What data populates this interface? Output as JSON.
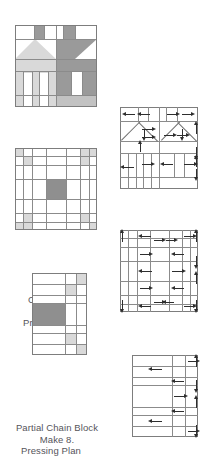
{
  "sheet": {
    "title_visible": false
  },
  "rows": [
    {
      "id": "house",
      "block": {
        "name": "House Block",
        "caption_line1": "House Block",
        "caption_line2": "Make 5.",
        "description": "Two-house pieced block: light-gray house on left, dark-gray house on right, each with chimney, roof triangles, wall band, and door/window strips.",
        "grid": "paired house units",
        "colors": {
          "background": "#ffffff",
          "light": "#d9d9d9",
          "medium": "#c2c2c2",
          "dark": "#9a9a9a",
          "line": "#8b8b8b"
        }
      },
      "plan": {
        "name": "Pressing Plan",
        "caption_line1": "Pressing Plan",
        "caption_line2": "",
        "arrow_count": 14,
        "arrow_directions": [
          "left",
          "left",
          "right",
          "right",
          "right",
          "right",
          "right",
          "right",
          "up",
          "left",
          "left",
          "left",
          "right",
          "right"
        ],
        "edge_arrows": [
          "up",
          "down",
          "up",
          "down",
          "up"
        ]
      }
    },
    {
      "id": "chain",
      "block": {
        "name": "Chain Block",
        "caption_line1": "Chain Block",
        "caption_line2": "Make 4.",
        "description": "Five-patch chain block with light-gray four-patch units in each corner and a dark-gray center square.",
        "grid": "5 x 5",
        "colors": {
          "background": "#ffffff",
          "light": "#d9d9d9",
          "dark": "#9a9a9a",
          "line": "#8b8b8b"
        }
      },
      "plan": {
        "name": "Pressing Plan",
        "caption_line1": "Pressing Plan",
        "caption_line2": "",
        "arrow_count": 14,
        "arrow_directions": [
          "left",
          "right",
          "right",
          "left",
          "left",
          "right",
          "left",
          "right",
          "left",
          "right",
          "left",
          "right",
          "left",
          "right"
        ],
        "edge_arrows": [
          "up",
          "up",
          "down",
          "up",
          "down",
          "down"
        ]
      }
    },
    {
      "id": "partial",
      "block": {
        "name": "Partial Chain Block",
        "caption_line1": "Partial Chain Block",
        "caption_line2": "Make 8.",
        "description": "Three-column partial chain block with light-gray four-patch units on the right edge and a dark-gray square at the left middle.",
        "grid": "3 x 5",
        "colors": {
          "background": "#ffffff",
          "light": "#d9d9d9",
          "dark": "#9a9a9a",
          "line": "#8b8b8b"
        }
      },
      "plan": {
        "name": "Pressing Plan",
        "caption_line1": "Pressing Plan",
        "caption_line2": "",
        "arrow_count": 8,
        "arrow_directions": [
          "left",
          "right",
          "left",
          "right",
          "left",
          "left",
          "right"
        ],
        "edge_arrows": [
          "up",
          "down",
          "up",
          "down"
        ]
      }
    }
  ]
}
